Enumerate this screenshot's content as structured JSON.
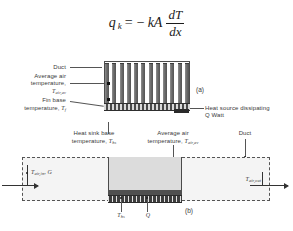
{
  "equation": {
    "lhs_var": "q",
    "lhs_sub": "k",
    "equals": "=",
    "minus": "−",
    "coeff": "kA",
    "numerator": "dT",
    "denominator": "dx",
    "plain": "q_k = -kA dT/dx"
  },
  "panel_a": {
    "tag": "(a)",
    "fin_count": 12,
    "labels": {
      "duct": "Duct",
      "avg_air_line1": "Average air",
      "avg_air_line2": "temperature,",
      "avg_air_symbol": "T",
      "avg_air_symbol_sub": "air,av",
      "fin_base_line1": "Fin base",
      "fin_base_line2": "temperature,",
      "fin_base_symbol": "T",
      "fin_base_symbol_sub": "f",
      "heat_source_line1": "Heat source dissipating",
      "heat_source_line2": "Q Watt"
    }
  },
  "panel_b": {
    "tag": "(b)",
    "labels": {
      "hs_base_line1": "Heat sink base",
      "hs_base_line2": "temperature,",
      "hs_base_symbol": "T",
      "hs_base_symbol_sub": "hs",
      "avg_air_line1": "Average air",
      "avg_air_line2": "temperature,",
      "avg_air_symbol": "T",
      "avg_air_symbol_sub": "air,av",
      "duct": "Duct",
      "inlet_symbol": "T",
      "inlet_sub": "air,in",
      "inlet_extra": ", G",
      "outlet_symbol": "T",
      "outlet_sub": "air,out",
      "base_temp_symbol": "T",
      "base_temp_sub": "hs",
      "heat_symbol": "Q"
    }
  },
  "colors": {
    "fin": "#6b6b6b",
    "base": "#4a4a4a",
    "duct_outline": "#4d4d4d",
    "hs_block": "#dcdcdc",
    "duct_fill": "#f4f4f4",
    "text": "#3a3a3a"
  }
}
